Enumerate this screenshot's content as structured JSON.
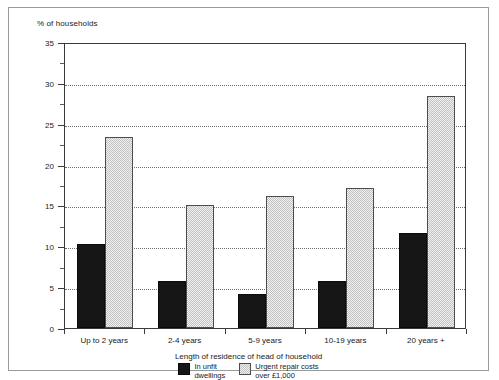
{
  "chart_data": {
    "type": "bar",
    "title": "",
    "ylabel": "% of households",
    "xlabel": "Length of residence of head of household",
    "categories": [
      "Up to 2 years",
      "2-4 years",
      "5-9 years",
      "10-19 years",
      "20 years +"
    ],
    "series": [
      {
        "name": "In unfit\ndwellings",
        "values": [
          10.3,
          5.7,
          4.2,
          5.7,
          11.6
        ],
        "color": "#161616"
      },
      {
        "name": "Urgent repair costs\nover £1,000",
        "values": [
          23.4,
          15.1,
          16.1,
          17.1,
          28.4
        ],
        "color": "#c2c2c2"
      }
    ],
    "ylim": [
      0,
      35
    ],
    "ytick_labels": [
      "0",
      "5",
      "10",
      "15",
      "20",
      "25",
      "30",
      "35"
    ],
    "ytick_values": [
      0,
      5,
      10,
      15,
      20,
      25,
      30,
      35
    ],
    "yminor_values": [
      2.5,
      7.5,
      12.5,
      17.5,
      22.5,
      27.5,
      32.5
    ],
    "grid": "horizontal-dotted",
    "legend_position": "bottom-center"
  }
}
